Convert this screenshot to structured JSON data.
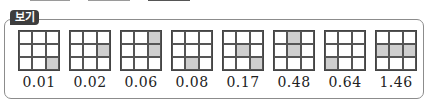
{
  "box": {
    "label": "보기",
    "items": [
      {
        "value": "0.01",
        "shaded": [
          8
        ]
      },
      {
        "value": "0.02",
        "shaded": [
          5
        ]
      },
      {
        "value": "0.06",
        "shaded": [
          2,
          5
        ]
      },
      {
        "value": "0.08",
        "shaded": [
          7
        ]
      },
      {
        "value": "0.17",
        "shaded": [
          4,
          8
        ]
      },
      {
        "value": "0.48",
        "shaded": [
          1,
          4
        ]
      },
      {
        "value": "0.64",
        "shaded": [
          6
        ]
      },
      {
        "value": "1.46",
        "shaded": [
          3,
          4,
          5
        ]
      }
    ]
  },
  "colors": {
    "shade": "#cfcfcf",
    "label_bg": "#3d3d3d",
    "frame": "#8c8c8c"
  }
}
